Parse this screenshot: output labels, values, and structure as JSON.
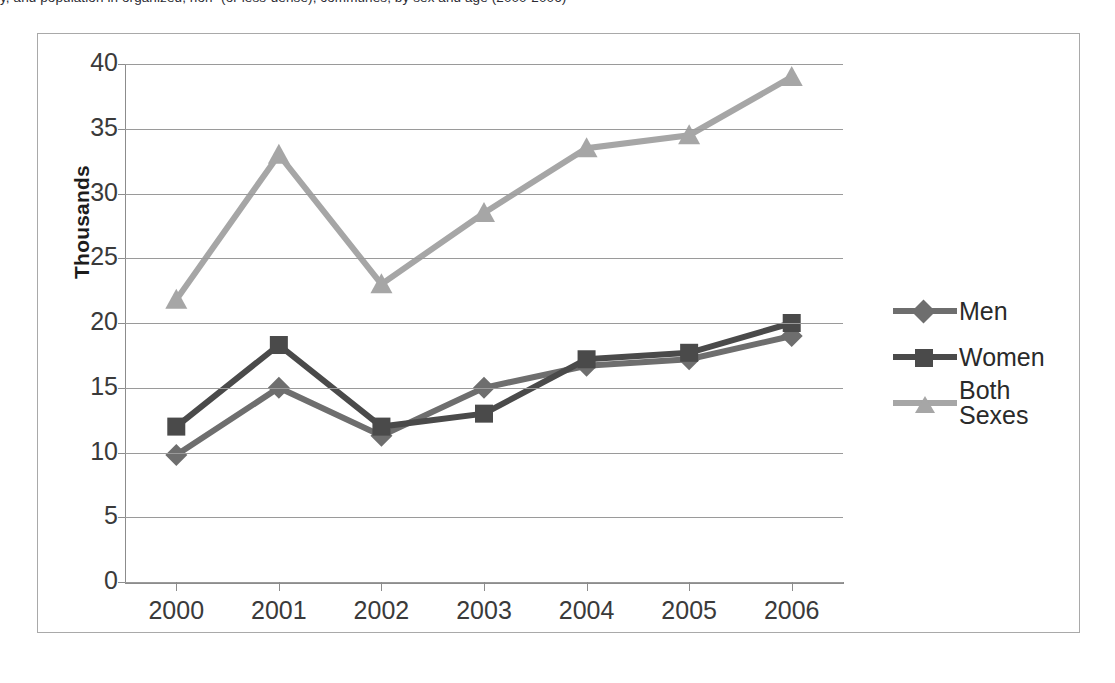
{
  "caption": {
    "text": "y, and population in organized, non- (or less-dense), communes, by sex and age (2000-2006)"
  },
  "chart_frame": {
    "border_color": "#a9a9a9"
  },
  "axis": {
    "y_title": "Thousands",
    "y_ticks": [
      "40",
      "35",
      "30",
      "25",
      "20",
      "15",
      "10",
      "5",
      "0"
    ],
    "x_ticks": [
      "2000",
      "2001",
      "2002",
      "2003",
      "2004",
      "2005",
      "2006"
    ],
    "gridline_color": "#9a9a9a",
    "axis_color": "#8c8c8c"
  },
  "legend": {
    "position": "right",
    "entries": [
      {
        "label": "Men",
        "marker": "diamond-marker",
        "color": "#6e6e6e"
      },
      {
        "label": "Women",
        "marker": "square-marker",
        "color": "#4a4a4a"
      },
      {
        "label": "Both Sexes",
        "marker": "triangle-marker",
        "color": "#a6a6a6"
      }
    ]
  },
  "chart_data": {
    "type": "line",
    "title": "",
    "subtitle": "",
    "xlabel": "",
    "ylabel": "Thousands",
    "categories": [
      "2000",
      "2001",
      "2002",
      "2003",
      "2004",
      "2005",
      "2006"
    ],
    "ylim": [
      0,
      40
    ],
    "ytick_step": 5,
    "grid": true,
    "legend_position": "right",
    "series": [
      {
        "name": "Men",
        "marker": "diamond",
        "color": "#6e6e6e",
        "values": [
          9.8,
          15.0,
          11.3,
          15.0,
          16.7,
          17.2,
          19.0
        ]
      },
      {
        "name": "Women",
        "marker": "square",
        "color": "#4a4a4a",
        "values": [
          12.0,
          18.3,
          12.0,
          13.0,
          17.2,
          17.7,
          20.0
        ]
      },
      {
        "name": "Both Sexes",
        "marker": "triangle",
        "color": "#a6a6a6",
        "values": [
          21.8,
          33.0,
          23.0,
          28.5,
          33.5,
          34.5,
          39.0
        ]
      }
    ]
  }
}
